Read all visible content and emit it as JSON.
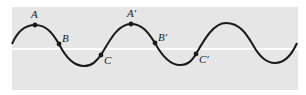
{
  "figure": {
    "colors": {
      "background": "#ffffff",
      "panel": "#e6e6e6",
      "axis_line": "#ffffff",
      "wave": "#1a1a1a",
      "point": "#1a1a1a"
    },
    "points": [
      {
        "id": "A",
        "label": "A"
      },
      {
        "id": "B",
        "label": "B"
      },
      {
        "id": "C",
        "label": "C"
      },
      {
        "id": "A2",
        "label": "A′"
      },
      {
        "id": "B2",
        "label": "B′"
      },
      {
        "id": "C2",
        "label": "C′"
      }
    ]
  }
}
